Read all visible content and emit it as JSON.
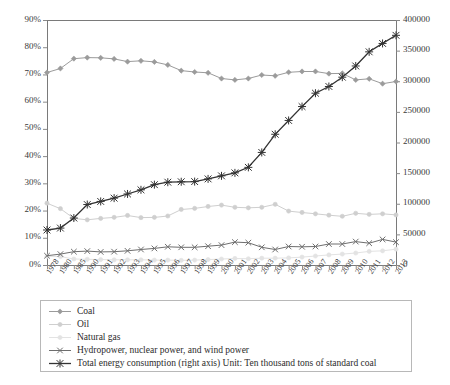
{
  "chart_data": {
    "type": "line",
    "title": "",
    "xlabel": "",
    "ylabel": "",
    "grid": false,
    "legend_position": "bottom",
    "categories": [
      "1978",
      "1980",
      "1985",
      "1990",
      "1991",
      "1992",
      "1993",
      "1994",
      "1995",
      "1996",
      "1997",
      "1998",
      "1999",
      "2000",
      "2001",
      "2002",
      "2003",
      "2004",
      "2005",
      "2006",
      "2007",
      "2008",
      "2009",
      "2010",
      "2011",
      "2012",
      "2013"
    ],
    "left_axis": {
      "label": "",
      "ylim": [
        0,
        90
      ],
      "unit": "%",
      "ticks": [
        "0%",
        "10%",
        "20%",
        "30%",
        "40%",
        "50%",
        "60%",
        "70%",
        "80%",
        "90%"
      ],
      "tick_values": [
        0,
        10,
        20,
        30,
        40,
        50,
        60,
        70,
        80,
        90
      ]
    },
    "right_axis": {
      "label": "",
      "ylim": [
        0,
        400000
      ],
      "ticks": [
        "0",
        "50000",
        "100000",
        "150000",
        "200000",
        "250000",
        "300000",
        "350000",
        "400000"
      ],
      "tick_values": [
        0,
        50000,
        100000,
        150000,
        200000,
        250000,
        300000,
        350000,
        400000
      ]
    },
    "series": [
      {
        "name": "Coal",
        "axis": "left",
        "color": "#9b9b9b",
        "marker": "diamond",
        "values": [
          70.7,
          72.2,
          75.8,
          76.2,
          76.1,
          75.7,
          74.7,
          75.0,
          74.6,
          73.5,
          71.4,
          70.9,
          70.6,
          68.5,
          68.0,
          68.5,
          69.8,
          69.5,
          70.8,
          71.1,
          71.1,
          70.3,
          70.4,
          68.0,
          68.4,
          66.6,
          67.4
        ]
      },
      {
        "name": "Oil",
        "axis": "left",
        "color": "#cfcfcf",
        "marker": "circle",
        "values": [
          22.7,
          20.7,
          17.1,
          16.6,
          17.1,
          17.5,
          18.2,
          17.4,
          17.5,
          18.0,
          20.4,
          20.8,
          21.5,
          22.0,
          21.2,
          21.0,
          21.2,
          22.3,
          19.8,
          19.3,
          18.8,
          18.3,
          17.9,
          19.0,
          18.6,
          18.8,
          18.4
        ]
      },
      {
        "name": "Natural gas",
        "axis": "left",
        "color": "#e3e3e3",
        "marker": "circle",
        "values": [
          3.2,
          3.1,
          2.2,
          2.1,
          2.0,
          1.9,
          1.9,
          1.9,
          1.8,
          1.8,
          1.7,
          1.8,
          2.0,
          2.2,
          2.4,
          2.3,
          2.5,
          2.5,
          2.6,
          2.9,
          3.3,
          3.7,
          4.0,
          4.4,
          5.0,
          5.2,
          5.8
        ]
      },
      {
        "name": "Hydropower, nuclear power, and wind power",
        "axis": "left",
        "color": "#6e6e6e",
        "marker": "cross",
        "values": [
          3.4,
          4.0,
          4.9,
          5.1,
          4.8,
          4.9,
          5.2,
          5.7,
          6.1,
          6.7,
          6.5,
          6.5,
          6.9,
          7.3,
          8.4,
          8.2,
          6.5,
          5.7,
          6.8,
          6.7,
          6.8,
          7.7,
          7.7,
          8.6,
          8.0,
          9.4,
          8.4
        ]
      },
      {
        "name": "Total energy consumption (right axis) Unit: Ten thousand tons of standard coal",
        "axis": "right",
        "color": "#333333",
        "marker": "asterisk",
        "values": [
          57144,
          60275,
          76682,
          98703,
          103783,
          109170,
          115993,
          122737,
          131176,
          135192,
          135909,
          136184,
          140569,
          145531,
          150406,
          159431,
          183792,
          213456,
          235997,
          258676,
          280508,
          291448,
          306647,
          324939,
          348002,
          361732,
          375000
        ]
      }
    ]
  },
  "legend": {
    "items": [
      {
        "label": "Coal"
      },
      {
        "label": "Oil"
      },
      {
        "label": "Natural gas"
      },
      {
        "label": "Hydropower, nuclear power, and wind power"
      },
      {
        "label": "Total energy consumption (right axis) Unit: Ten thousand tons of standard coal"
      }
    ]
  }
}
